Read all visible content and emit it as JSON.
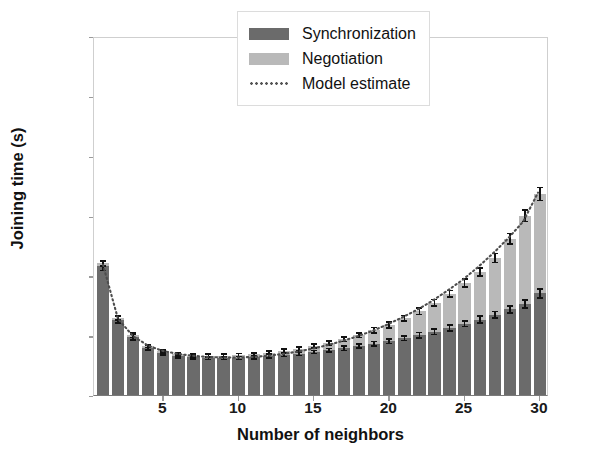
{
  "chart_data": {
    "type": "bar",
    "title": "",
    "xlabel": "Number of neighbors",
    "ylabel": "Joining time (s)",
    "xlim": [
      0.4,
      30.6
    ],
    "ylim": [
      0,
      600
    ],
    "xticks": [
      5,
      10,
      15,
      20,
      25,
      30
    ],
    "yticks": [
      0,
      100,
      200,
      300,
      400,
      500,
      600
    ],
    "grid": false,
    "stacked": true,
    "legend_position": "upper right",
    "categories": [
      1,
      2,
      3,
      4,
      5,
      6,
      7,
      8,
      9,
      10,
      11,
      12,
      13,
      14,
      15,
      16,
      17,
      18,
      19,
      20,
      21,
      22,
      23,
      24,
      25,
      26,
      27,
      28,
      29,
      30
    ],
    "series": [
      {
        "name": "Synchronization",
        "color": "#6b6b6b",
        "values": [
          216,
          126,
          97,
          79,
          70,
          65,
          63,
          62,
          62,
          62,
          63,
          65,
          67,
          69,
          72,
          75,
          78,
          82,
          86,
          90,
          95,
          100,
          106,
          112,
          119,
          126,
          134,
          143,
          152,
          170
        ],
        "errors": [
          9,
          7,
          6,
          5,
          4,
          4,
          4,
          4,
          4,
          4,
          4,
          4,
          4,
          4,
          4,
          4,
          5,
          5,
          5,
          5,
          5,
          6,
          6,
          6,
          6,
          7,
          7,
          7,
          8,
          9
        ]
      },
      {
        "name": "Negotiation",
        "color": "#b9b9b9",
        "values": [
          4,
          3,
          3,
          3,
          3,
          3,
          3,
          4,
          4,
          5,
          5,
          6,
          7,
          8,
          10,
          12,
          15,
          18,
          22,
          27,
          33,
          40,
          48,
          57,
          68,
          80,
          95,
          118,
          148,
          166
        ],
        "errors": [
          6,
          5,
          5,
          4,
          4,
          4,
          4,
          4,
          4,
          4,
          4,
          4,
          4,
          5,
          5,
          5,
          5,
          5,
          6,
          6,
          6,
          7,
          7,
          7,
          8,
          8,
          9,
          10,
          11,
          12
        ]
      }
    ],
    "totals": [
      220,
      129,
      100,
      82,
      73,
      68,
      66,
      66,
      66,
      67,
      68,
      71,
      74,
      77,
      82,
      87,
      93,
      100,
      108,
      117,
      128,
      140,
      154,
      169,
      187,
      206,
      229,
      261,
      300,
      336
    ],
    "model_estimate": {
      "name": "Model estimate",
      "style": "dotted",
      "color": "#4d4d4d",
      "x": [
        1,
        2,
        3,
        4,
        5,
        6,
        7,
        8,
        9,
        10,
        11,
        12,
        13,
        14,
        15,
        16,
        17,
        18,
        19,
        20,
        21,
        22,
        23,
        24,
        25,
        26,
        27,
        28,
        29,
        30
      ],
      "y": [
        219,
        128,
        99,
        83,
        74,
        69,
        66,
        64,
        63,
        63,
        64,
        66,
        69,
        73,
        78,
        84,
        91,
        99,
        108,
        119,
        131,
        144,
        159,
        176,
        194,
        215,
        238,
        263,
        291,
        340
      ]
    }
  },
  "axis": {
    "ylabel": "Joining time (s)",
    "xlabel": "Number of neighbors",
    "yticklabels": [
      "0",
      "100",
      "200",
      "300",
      "400",
      "500",
      "600"
    ],
    "xticklabels": [
      "5",
      "10",
      "15",
      "20",
      "25",
      "30"
    ]
  },
  "legend": {
    "items": [
      {
        "label": "Synchronization",
        "key": "swatch-dark-gray"
      },
      {
        "label": "Negotiation",
        "key": "swatch-light-gray"
      },
      {
        "label": "Model estimate",
        "key": "dotted-line"
      }
    ]
  },
  "colors": {
    "synchronization": "#6b6b6b",
    "negotiation": "#b9b9b9",
    "model_estimate": "#4d4d4d",
    "errorbar": "#111111",
    "background": "#ffffff"
  }
}
